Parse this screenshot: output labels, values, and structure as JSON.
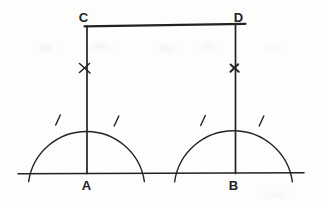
{
  "labels": {
    "A": "A",
    "B": "B",
    "C": "C",
    "D": "D"
  },
  "colors": {
    "ink": "#222222",
    "background": "#fdfdfc"
  },
  "marks": {
    "x_mark": "×",
    "arc_tick": "/"
  }
}
